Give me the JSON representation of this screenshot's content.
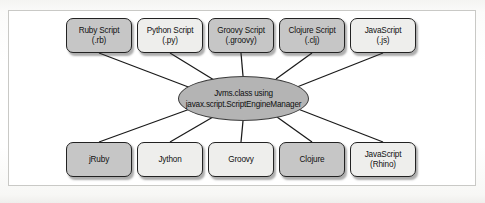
{
  "figure": {
    "frame_color": "#c9c9c6",
    "node_dark_fill": "#c6c6c6",
    "node_light_fill": "#eeeeec",
    "hub_fill": "#b4b4b4",
    "edge_color": "#1a1a1a"
  },
  "hub": {
    "line1": "Jvms.class using",
    "line2": "javax.script.ScriptEngineManager"
  },
  "top_row": [
    {
      "line1": "Ruby Script",
      "line2": "(.rb)",
      "shade": "dark"
    },
    {
      "line1": "Python Script",
      "line2": "(.py)",
      "shade": "light"
    },
    {
      "line1": "Groovy Script",
      "line2": "(.groovy)",
      "shade": "dark"
    },
    {
      "line1": "Clojure Script",
      "line2": "(.clj)",
      "shade": "dark"
    },
    {
      "line1": "JavaScript",
      "line2": "(.js)",
      "shade": "light"
    }
  ],
  "bottom_row": [
    {
      "line1": "jRuby",
      "line2": "",
      "shade": "dark"
    },
    {
      "line1": "Jython",
      "line2": "",
      "shade": "light"
    },
    {
      "line1": "Groovy",
      "line2": "",
      "shade": "light"
    },
    {
      "line1": "Clojure",
      "line2": "",
      "shade": "dark"
    },
    {
      "line1": "JavaScript",
      "line2": "(Rhino)",
      "shade": "light"
    }
  ]
}
